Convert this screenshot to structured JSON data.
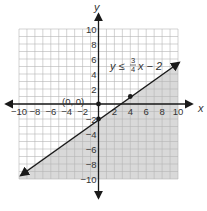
{
  "chart_data": {
    "type": "line",
    "title": "",
    "xlabel": "x",
    "ylabel": "y",
    "xlim": [
      -10,
      10
    ],
    "ylim": [
      -10,
      10
    ],
    "grid": true,
    "x_ticks": [
      -10,
      -8,
      -6,
      -4,
      -2,
      2,
      4,
      6,
      8,
      10
    ],
    "y_ticks": [
      10,
      8,
      6,
      4,
      2,
      -2,
      -4,
      -6,
      -8,
      -10
    ],
    "x_tick_labels": [
      "−10",
      "−8",
      "−6",
      "−4",
      "−2",
      "2",
      "4",
      "6",
      "8",
      "10"
    ],
    "y_tick_labels": [
      "10",
      "8",
      "6",
      "4",
      "2",
      "−2",
      "−4",
      "−6",
      "−8",
      "−10"
    ],
    "series": [
      {
        "name": "boundary line",
        "equation": "y = 3/4 x − 2",
        "slope": 0.75,
        "intercept": -2,
        "style": "solid",
        "arrows": "both",
        "x": [
          -10,
          10
        ],
        "y": [
          -9.5,
          5.5
        ]
      }
    ],
    "shaded_region": "below the line (y ≤ 3/4 x − 2)",
    "points": [
      {
        "label": "(0, 0)",
        "x": 0,
        "y": 0
      },
      {
        "label": "",
        "x": 0,
        "y": -2
      },
      {
        "label": "",
        "x": 4,
        "y": 1
      }
    ],
    "annotations": [
      {
        "text_prefix": "y ≤ ",
        "numerator": "3",
        "denominator": "4",
        "text_suffix": "x − 2",
        "position": "upper right"
      },
      {
        "text": "(0, 0)",
        "position": "near origin, upper left"
      }
    ]
  },
  "labels": {
    "x_axis": "x",
    "y_axis": "y",
    "origin_point": "(0, 0)",
    "eq_prefix": "y ≤ ",
    "eq_num": "3",
    "eq_den": "4",
    "eq_suffix": "x − 2"
  },
  "colors": {
    "grid": "#b5b5b5",
    "shade": "#d9d9d9",
    "axis": "#1a1a1a",
    "line": "#1a1a1a",
    "text": "#333333"
  }
}
